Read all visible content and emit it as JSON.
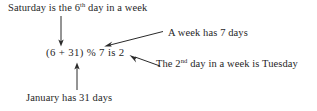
{
  "figure": {
    "type": "annotated-expression-diagram",
    "background_color": "#ffffff",
    "ink_color": "#1f1f1f"
  },
  "labels": {
    "saturday_note_prefix": "Saturday is the 6",
    "saturday_note_sup": "th",
    "saturday_note_suffix": " day in a week",
    "expression": "(6 + 31) % 7 is 2",
    "week_note": "A week has 7 days",
    "tuesday_note_prefix": "The 2",
    "tuesday_note_sup": "nd",
    "tuesday_note_suffix": " day in a week is Tuesday",
    "january_note": "January has 31 days"
  },
  "arrows": [
    {
      "name": "arrow-saturday-to-six",
      "from": "saturday-note",
      "to": "expression-operand-6",
      "direction": "down"
    },
    {
      "name": "arrow-january-to-thirtyone",
      "from": "january-note",
      "to": "expression-operand-31",
      "direction": "up"
    },
    {
      "name": "arrow-week-to-seven",
      "from": "week-note",
      "to": "expression-modulus-7",
      "direction": "down-left"
    },
    {
      "name": "arrow-tuesday-to-two",
      "from": "tuesday-note",
      "to": "expression-result-2",
      "direction": "up-left"
    }
  ]
}
